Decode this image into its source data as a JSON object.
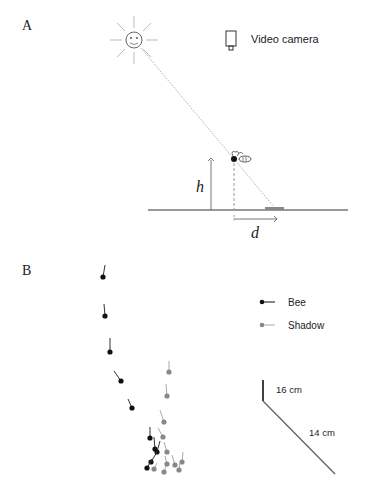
{
  "panel_a": {
    "label": "A",
    "camera_label": "Video camera",
    "height_label": "h",
    "distance_label": "d",
    "icons": [
      "sun-icon",
      "video-camera-icon",
      "bee-icon",
      "shadow-marker"
    ]
  },
  "panel_b": {
    "label": "B",
    "legend": [
      {
        "label": "Bee",
        "color": "#111111"
      },
      {
        "label": "Shadow",
        "color": "#888888"
      }
    ],
    "scale_vertical_label": "16 cm",
    "scale_diagonal_label": "14 cm",
    "bee_points": [
      {
        "x": 103,
        "y": 277,
        "tx": 105,
        "ty": 265
      },
      {
        "x": 105,
        "y": 316,
        "tx": 104,
        "ty": 304
      },
      {
        "x": 110,
        "y": 352,
        "tx": 110,
        "ty": 338
      },
      {
        "x": 121,
        "y": 381,
        "tx": 114,
        "ty": 371
      },
      {
        "x": 132,
        "y": 408,
        "tx": 128,
        "ty": 399
      },
      {
        "x": 150,
        "y": 438,
        "tx": 150,
        "ty": 427
      },
      {
        "x": 155,
        "y": 449,
        "tx": 154,
        "ty": 437
      },
      {
        "x": 157,
        "y": 452,
        "tx": 160,
        "ty": 441
      },
      {
        "x": 151,
        "y": 462,
        "tx": 157,
        "ty": 452
      },
      {
        "x": 147,
        "y": 468,
        "tx": 152,
        "ty": 459
      }
    ],
    "shadow_points": [
      {
        "x": 169,
        "y": 372,
        "tx": 169,
        "ty": 361
      },
      {
        "x": 167,
        "y": 396,
        "tx": 166,
        "ty": 384
      },
      {
        "x": 164,
        "y": 422,
        "tx": 160,
        "ty": 410
      },
      {
        "x": 163,
        "y": 437,
        "tx": 158,
        "ty": 428
      },
      {
        "x": 167,
        "y": 452,
        "tx": 164,
        "ty": 442
      },
      {
        "x": 167,
        "y": 464,
        "tx": 165,
        "ty": 456
      },
      {
        "x": 175,
        "y": 465,
        "tx": 172,
        "ty": 455
      },
      {
        "x": 182,
        "y": 462,
        "tx": 183,
        "ty": 452
      },
      {
        "x": 179,
        "y": 470,
        "tx": 180,
        "ty": 462
      },
      {
        "x": 164,
        "y": 472,
        "tx": 166,
        "ty": 466
      },
      {
        "x": 154,
        "y": 469,
        "tx": 157,
        "ty": 463
      }
    ]
  }
}
